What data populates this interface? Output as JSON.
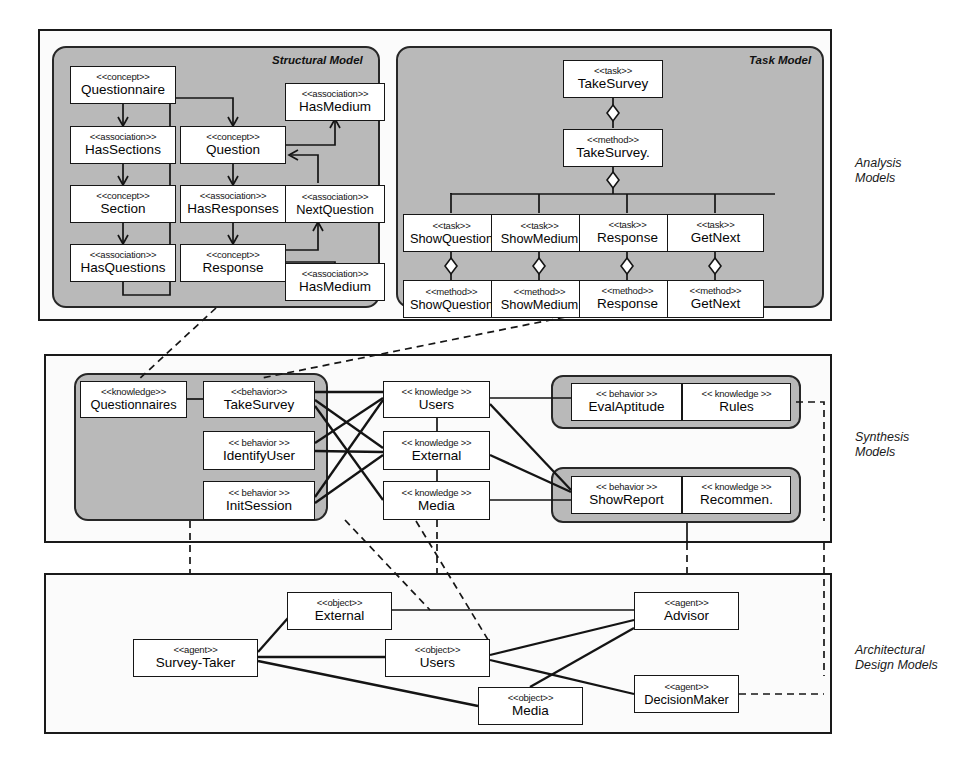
{
  "diagram": {
    "layers": [
      {
        "id": "analysis",
        "caption": "Analysis\nModels"
      },
      {
        "id": "synthesis",
        "caption": "Synthesis\nModels"
      },
      {
        "id": "architectural",
        "caption": "Architectural\nDesign Models"
      }
    ],
    "groups": [
      {
        "id": "structural-model",
        "title": "Structural Model"
      },
      {
        "id": "task-model",
        "title": "Task Model"
      }
    ],
    "colors": {
      "group_fill": "#b9b9b9",
      "layer_fill": "#fbfbfb",
      "node_fill": "#ffffff",
      "stroke": "#141414"
    }
  },
  "structural_model": {
    "nodes": [
      {
        "id": "questionnaire",
        "stereotype": "<<concept>>",
        "name": "Questionnaire"
      },
      {
        "id": "hassections",
        "stereotype": "<<association>>",
        "name": "HasSections"
      },
      {
        "id": "section",
        "stereotype": "<<concept>>",
        "name": "Section"
      },
      {
        "id": "hasquestions",
        "stereotype": "<<association>>",
        "name": "HasQuestions"
      },
      {
        "id": "question",
        "stereotype": "<<concept>>",
        "name": "Question"
      },
      {
        "id": "hasresponses",
        "stereotype": "<<association>>",
        "name": "HasResponses"
      },
      {
        "id": "response",
        "stereotype": "<<concept>>",
        "name": "Response"
      },
      {
        "id": "hasmedium-top",
        "stereotype": "<<association>>",
        "name": "HasMedium"
      },
      {
        "id": "nextquestion",
        "stereotype": "<<association>>",
        "name": "NextQuestion"
      },
      {
        "id": "hasmedium-bot",
        "stereotype": "<<association>>",
        "name": "HasMedium"
      }
    ]
  },
  "task_model": {
    "nodes": [
      {
        "id": "task-takesurvey",
        "stereotype": "<<task>>",
        "name": "TakeSurvey"
      },
      {
        "id": "method-takesurvey",
        "stereotype": "<<method>>",
        "name": "TakeSurvey."
      },
      {
        "id": "task-showquestion",
        "stereotype": "<<task>>",
        "name": "ShowQuestion"
      },
      {
        "id": "task-showmedium",
        "stereotype": "<<task>>",
        "name": "ShowMedium"
      },
      {
        "id": "task-response",
        "stereotype": "<<task>>",
        "name": "Response"
      },
      {
        "id": "task-getnext",
        "stereotype": "<<task>>",
        "name": "GetNext"
      },
      {
        "id": "method-showquestion",
        "stereotype": "<<method>>",
        "name": "ShowQuestion"
      },
      {
        "id": "method-showmedium",
        "stereotype": "<<method>>",
        "name": "ShowMedium"
      },
      {
        "id": "method-response",
        "stereotype": "<<method>>",
        "name": "Response"
      },
      {
        "id": "method-getnext",
        "stereotype": "<<method>>",
        "name": "GetNext"
      }
    ]
  },
  "synthesis_model": {
    "nodes": [
      {
        "id": "k-questionnaires",
        "stereotype": "<<knowledge>>",
        "name": "Questionnaires"
      },
      {
        "id": "b-takesurvey",
        "stereotype": "<<behavior>>",
        "name": "TakeSurvey"
      },
      {
        "id": "b-identifyuser",
        "stereotype": "<< behavior >>",
        "name": "IdentifyUser"
      },
      {
        "id": "b-initsession",
        "stereotype": "<< behavior >>",
        "name": "InitSession"
      },
      {
        "id": "k-users",
        "stereotype": "<< knowledge >>",
        "name": "Users"
      },
      {
        "id": "k-external",
        "stereotype": "<< knowledge >>",
        "name": "External"
      },
      {
        "id": "k-media",
        "stereotype": "<< knowledge >>",
        "name": "Media"
      },
      {
        "id": "b-evalaptitude",
        "stereotype": "<< behavior >>",
        "name": "EvalAptitude"
      },
      {
        "id": "k-rules",
        "stereotype": "<< knowledge >>",
        "name": "Rules"
      },
      {
        "id": "b-showreport",
        "stereotype": "<< behavior >>",
        "name": "ShowReport"
      },
      {
        "id": "k-recommen",
        "stereotype": "<< knowledge >>",
        "name": "Recommen."
      }
    ]
  },
  "architectural_model": {
    "nodes": [
      {
        "id": "o-external",
        "stereotype": "<<object>>",
        "name": "External"
      },
      {
        "id": "a-surveytaker",
        "stereotype": "<<agent>>",
        "name": "Survey-Taker"
      },
      {
        "id": "o-users",
        "stereotype": "<<object>>",
        "name": "Users"
      },
      {
        "id": "o-media",
        "stereotype": "<<object>>",
        "name": "Media"
      },
      {
        "id": "a-advisor",
        "stereotype": "<<agent>>",
        "name": "Advisor"
      },
      {
        "id": "a-decisionmaker",
        "stereotype": "<<agent>>",
        "name": "DecisionMaker"
      }
    ]
  }
}
